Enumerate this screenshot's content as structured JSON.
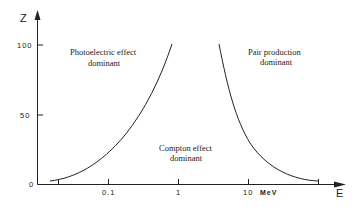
{
  "diagram": {
    "axes": {
      "y_label": "Z",
      "x_label": "E",
      "y_ticks": [
        {
          "label": "100",
          "y": 45
        },
        {
          "label": "50",
          "y": 115
        },
        {
          "label": "0",
          "y": 184
        }
      ],
      "x_ticks": [
        {
          "label": "",
          "x": 58
        },
        {
          "label": "0.1",
          "x": 108
        },
        {
          "label": "1",
          "x": 178
        },
        {
          "label": "10",
          "x": 248
        },
        {
          "label": "",
          "x": 318
        }
      ],
      "x_unit": "MeV"
    },
    "regions": {
      "photoelectric": {
        "line1": "Photoelectric effect",
        "line2": "dominant"
      },
      "pair": {
        "line1": "Pair production",
        "line2": "dominant"
      },
      "compton": {
        "line1": "Compton effect",
        "line2": "dominant"
      }
    },
    "colors": {
      "ink": "#222222",
      "background": "#ffffff"
    }
  }
}
